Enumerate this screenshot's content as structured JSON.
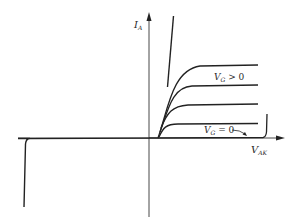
{
  "diagram": {
    "title": "",
    "type": "thyristor / SCR I-V characteristic",
    "axes": {
      "y_label_main": "I",
      "y_label_sub": "A",
      "x_label_main": "V",
      "x_label_sub": "AK"
    },
    "annotations": {
      "vg_positive_main": "V",
      "vg_positive_sub": "G",
      "vg_positive_rest": " > 0",
      "vg_zero_main": "V",
      "vg_zero_sub": "G",
      "vg_zero_rest": " = 0"
    },
    "curves": [
      {
        "name": "gate-curve-1",
        "saturation_level": "highest"
      },
      {
        "name": "gate-curve-2",
        "saturation_level": "high"
      },
      {
        "name": "gate-curve-3",
        "saturation_level": "medium"
      },
      {
        "name": "gate-curve-4",
        "saturation_level": "low"
      },
      {
        "name": "vg-zero-curve",
        "saturation_level": "off-state with breakover"
      }
    ],
    "colors": {
      "line": "#222222",
      "background": "#ffffff"
    }
  }
}
